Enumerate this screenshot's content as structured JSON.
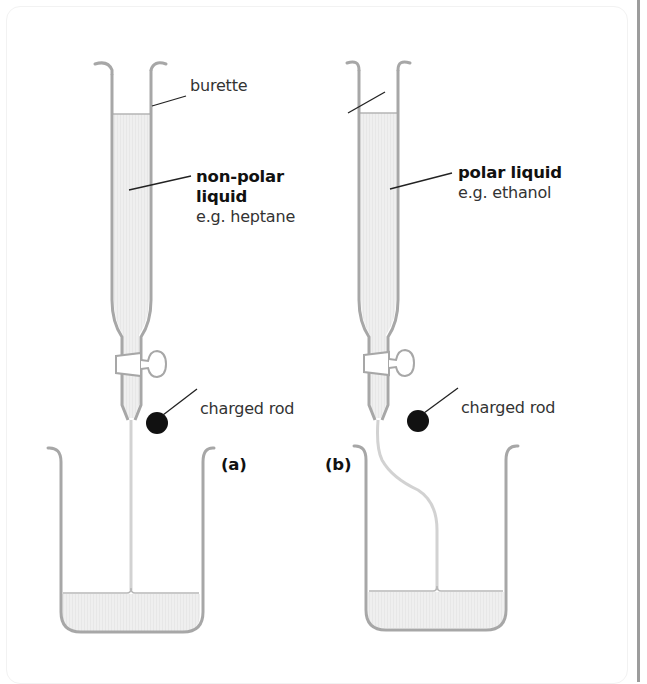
{
  "figure": {
    "colors": {
      "glass": "#a7a7a7",
      "liquid": "#ececec",
      "stream": "#d6d6d6",
      "rod": "#111111",
      "leader": "#222222",
      "text": "#333333",
      "border": "#9c9c9c"
    },
    "labels": {
      "burette": "burette",
      "a_liquid_name": "non-polar",
      "a_liquid_name2": "liquid",
      "a_example": "e.g. heptane",
      "b_liquid_name": "polar liquid",
      "b_example": "e.g. ethanol",
      "a_rod": "charged rod",
      "b_rod": "charged rod",
      "panel_a": "(a)",
      "panel_b": "(b)"
    }
  }
}
